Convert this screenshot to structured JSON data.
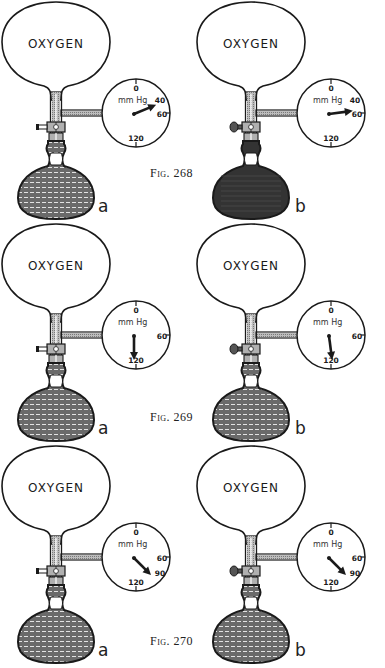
{
  "figures": [
    {
      "caption": "Fig. 268",
      "panels": [
        {
          "letter": "a",
          "bulb_label": "OXYGEN",
          "stopcock": "open",
          "flask_liquid": "hatched",
          "dial": {
            "unit": "mm Hg",
            "ticks": [
              "0",
              "40",
              "60",
              "120"
            ],
            "needle_value": 45
          }
        },
        {
          "letter": "b",
          "bulb_label": "OXYGEN",
          "stopcock": "closed",
          "flask_liquid": "dark",
          "dial": {
            "unit": "mm Hg",
            "ticks": [
              "0",
              "40",
              "60",
              "120"
            ],
            "needle_value": 55
          }
        }
      ]
    },
    {
      "caption": "Fig. 269",
      "panels": [
        {
          "letter": "a",
          "bulb_label": "OXYGEN",
          "stopcock": "open",
          "flask_liquid": "hatched",
          "dial": {
            "unit": "mm Hg",
            "ticks": [
              "0",
              "60",
              "120"
            ],
            "needle_value": 120
          }
        },
        {
          "letter": "b",
          "bulb_label": "OXYGEN",
          "stopcock": "closed",
          "flask_liquid": "hatched",
          "dial": {
            "unit": "mm Hg",
            "ticks": [
              "0",
              "60",
              "120"
            ],
            "needle_value": 115
          }
        }
      ]
    },
    {
      "caption": "Fig. 270",
      "panels": [
        {
          "letter": "a",
          "bulb_label": "OXYGEN",
          "stopcock": "open",
          "flask_liquid": "hatched",
          "dial": {
            "unit": "mm Hg",
            "ticks": [
              "0",
              "60",
              "90",
              "120"
            ],
            "needle_value": 90
          }
        },
        {
          "letter": "b",
          "bulb_label": "OXYGEN",
          "stopcock": "closed",
          "flask_liquid": "hatched",
          "dial": {
            "unit": "mm Hg",
            "ticks": [
              "0",
              "60",
              "90",
              "120"
            ],
            "needle_value": 90
          }
        }
      ]
    }
  ],
  "colors": {
    "ink": "#1a1a1a",
    "liquid_hatched": "#5a5a5a",
    "liquid_dark": "#333333",
    "tube_fill": "#9a9a9a"
  }
}
